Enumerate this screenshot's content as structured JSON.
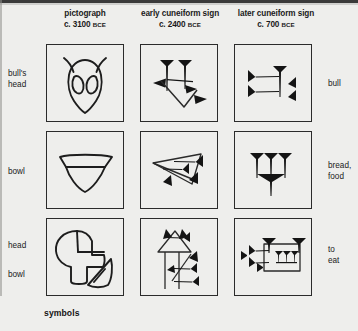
{
  "figure": {
    "caption": "symbols",
    "background_color": "#eeeeec",
    "ink_color": "#2b2b2b"
  },
  "columns": [
    {
      "id": "pictograph",
      "title": "pictograph",
      "date": "c. 3100 ",
      "era": "BCE"
    },
    {
      "id": "early-cuneiform",
      "title": "early cuneiform sign",
      "date": "c. 2400 ",
      "era": "BCE"
    },
    {
      "id": "later-cuneiform",
      "title": "later cuneiform sign",
      "date": "c. 700 ",
      "era": "BCE"
    }
  ],
  "rows": [
    {
      "id": "bull",
      "left_label_lines": [
        "bull's",
        "head"
      ],
      "right_label_lines": [
        "bull"
      ],
      "cells": [
        {
          "column": "pictograph",
          "description": "bull's head pictograph with two horns and two eyes"
        },
        {
          "column": "early-cuneiform",
          "description": "early cuneiform bull sign: two vertical wedges above a downward V"
        },
        {
          "column": "later-cuneiform",
          "description": "later cuneiform bull sign: two horizontal wedges, one vertical wedge, two small wedges"
        }
      ]
    },
    {
      "id": "bread",
      "left_label_lines": [
        "bowl"
      ],
      "right_label_lines": [
        "bread,",
        "food"
      ],
      "cells": [
        {
          "column": "pictograph",
          "description": "bowl pictograph: trapezoid rim above a curved bowl"
        },
        {
          "column": "early-cuneiform",
          "description": "early cuneiform bowl sign: triangular outline with inner wedges"
        },
        {
          "column": "later-cuneiform",
          "description": "later cuneiform bread sign: three vertical wedges above one vertical wedge"
        }
      ]
    },
    {
      "id": "eat",
      "left_label_lines": [
        "head",
        "bowl"
      ],
      "right_label_lines": [
        "to",
        "eat"
      ],
      "cells": [
        {
          "column": "pictograph",
          "description": "head profile pictograph with a bowl at lower right"
        },
        {
          "column": "early-cuneiform",
          "description": "early cuneiform to-eat sign: head wedge group over long verticals with side wedges"
        },
        {
          "column": "later-cuneiform",
          "description": "later cuneiform to-eat sign: boxed wedge cluster with side wedges"
        }
      ]
    }
  ]
}
